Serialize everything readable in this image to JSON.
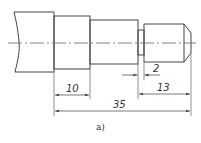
{
  "figure": {
    "caption": "a)",
    "type": "stepped shaft technical drawing",
    "colors": {
      "line": "#444444",
      "background": "#ffffff"
    }
  },
  "dimensions": {
    "step_length": "10",
    "groove_width": "2",
    "end_length": "13",
    "total_length": "35"
  }
}
